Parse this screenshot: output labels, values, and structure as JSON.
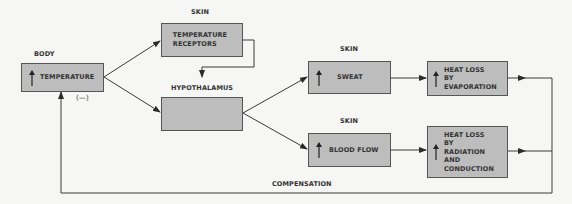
{
  "diagram": {
    "type": "feedback-loop",
    "labels": {
      "body": "BODY",
      "skin_top": "SKIN",
      "hypothalamus": "HYPOTHALAMUS",
      "skin_sweat": "SKIN",
      "skin_blood": "SKIN",
      "negative": "(—)",
      "compensation": "COMPENSATION"
    },
    "nodes": [
      {
        "id": "temperature",
        "text": "TEMPERATURE",
        "indicator": "up-arrow-icon",
        "group": "BODY"
      },
      {
        "id": "receptors",
        "line1": "TEMPERATURE",
        "line2": "RECEPTORS",
        "group": "SKIN"
      },
      {
        "id": "hypothalamus",
        "text": "",
        "group": "HYPOTHALAMUS"
      },
      {
        "id": "sweat",
        "text": "SWEAT",
        "indicator": "up-arrow-icon",
        "group": "SKIN"
      },
      {
        "id": "blood_flow",
        "text": "BLOOD FLOW",
        "indicator": "up-arrow-icon",
        "group": "SKIN"
      },
      {
        "id": "heat_loss_evap",
        "line1": "HEAT LOSS",
        "line2": "BY",
        "line3": "EVAPORATION",
        "indicator": "up-arrow-icon"
      },
      {
        "id": "heat_loss_rad",
        "line1": "HEAT LOSS",
        "line2": "BY",
        "line3": "RADIATION",
        "line4": "AND",
        "line5": "CONDUCTION",
        "indicator": "up-arrow-icon"
      }
    ],
    "edges": [
      {
        "from": "temperature",
        "to": "receptors"
      },
      {
        "from": "temperature",
        "to": "hypothalamus"
      },
      {
        "from": "receptors",
        "to": "hypothalamus"
      },
      {
        "from": "hypothalamus",
        "to": "sweat"
      },
      {
        "from": "hypothalamus",
        "to": "blood_flow"
      },
      {
        "from": "sweat",
        "to": "heat_loss_evap"
      },
      {
        "from": "blood_flow",
        "to": "heat_loss_rad"
      },
      {
        "from": "heat_loss_evap",
        "to": "temperature",
        "label": "COMPENSATION",
        "sign": "(—)"
      },
      {
        "from": "heat_loss_rad",
        "to": "temperature",
        "label": "COMPENSATION",
        "sign": "(—)"
      }
    ],
    "colors": {
      "box_fill": "#bdbdbd",
      "line": "#3a3a3a",
      "background": "#f6f6f4"
    }
  }
}
